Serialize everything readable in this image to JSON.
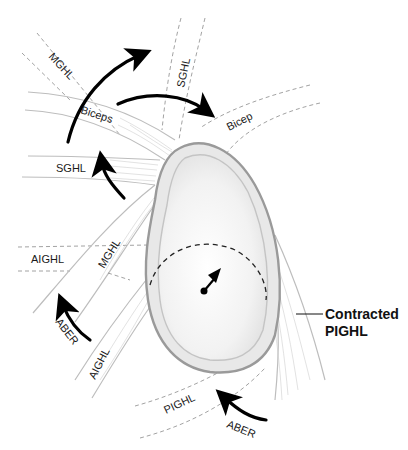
{
  "diagram": {
    "labels": {
      "mghl_top": "MGHL",
      "sghl_top": "SGHL",
      "biceps": "Biceps",
      "bicep": "Bicep",
      "sghl_left": "SGHL",
      "aighl_left": "AIGHL",
      "mghl_lower": "MGHL",
      "aighl_lower": "AIGHL",
      "aber_left": "ABER",
      "pighl": "PIGHL",
      "aber_bottom": "ABER",
      "contracted_line1": "Contracted",
      "contracted_line2": "PIGHL"
    },
    "colors": {
      "arrow": "#000000",
      "glenoid_rim": "#9a9a9a",
      "glenoid_fill": "#f3f3f3",
      "ligament": "#bdbdbd",
      "dashed_outline": "#8a8a8a"
    }
  }
}
